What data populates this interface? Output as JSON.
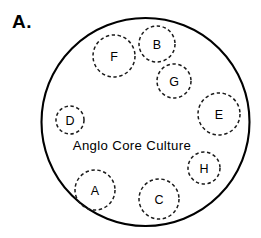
{
  "figure": {
    "panel_label": "A.",
    "background_color": "#ffffff",
    "stroke_color": "#000000",
    "width": 261,
    "height": 238
  },
  "core": {
    "label": "Anglo Core Culture",
    "label_x": 132,
    "label_y": 145,
    "cx": 145.5,
    "cy": 122,
    "r": 104,
    "style": "solid"
  },
  "subgroups": [
    {
      "id": "F",
      "label": "F",
      "cx": 114,
      "cy": 56,
      "r": 21,
      "style": "dashed"
    },
    {
      "id": "B",
      "label": "B",
      "cx": 157,
      "cy": 44,
      "r": 18,
      "style": "dashed"
    },
    {
      "id": "G",
      "label": "G",
      "cx": 174,
      "cy": 81,
      "r": 17,
      "style": "dashed"
    },
    {
      "id": "E",
      "label": "E",
      "cx": 219,
      "cy": 114,
      "r": 21,
      "style": "dashed"
    },
    {
      "id": "D",
      "label": "D",
      "cx": 70,
      "cy": 120,
      "r": 14,
      "style": "dashed"
    },
    {
      "id": "H",
      "label": "H",
      "cx": 204,
      "cy": 168,
      "r": 16,
      "style": "dashed"
    },
    {
      "id": "A",
      "label": "A",
      "cx": 95,
      "cy": 190,
      "r": 20,
      "style": "dashed"
    },
    {
      "id": "C",
      "label": "C",
      "cx": 159,
      "cy": 199,
      "r": 20,
      "style": "dashed"
    }
  ]
}
